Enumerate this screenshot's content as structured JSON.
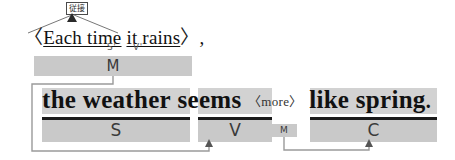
{
  "diagram": {
    "type": "english-sentence-structure-annotation",
    "subordinate_clause": {
      "open_bracket": "〈",
      "text_sub": "Each time",
      "text_rest": "it rains",
      "close_bracket": "〉",
      "comma": ",",
      "tag_label": "従接",
      "role_marks": [
        {
          "name": "subject-prime",
          "text": "S'"
        },
        {
          "name": "verb-prime",
          "text": "V'"
        }
      ],
      "bar_label": "M"
    },
    "main_clause": {
      "subject": "the weather",
      "verb": "seems",
      "modifier": "〈more〉",
      "complement": "like spring",
      "period": ".",
      "bars": [
        {
          "name": "subject-bar",
          "label": "S"
        },
        {
          "name": "verb-bar",
          "label": "V"
        },
        {
          "name": "modifier-bar",
          "label": "M"
        },
        {
          "name": "complement-bar",
          "label": "C"
        }
      ]
    },
    "colors": {
      "bar_fill": "#c9c9c9",
      "highlight_fill": "#d2d2d2",
      "bar_cap": "#1b1b1b",
      "connector": "#9a9a9a",
      "text": "#111111"
    }
  }
}
